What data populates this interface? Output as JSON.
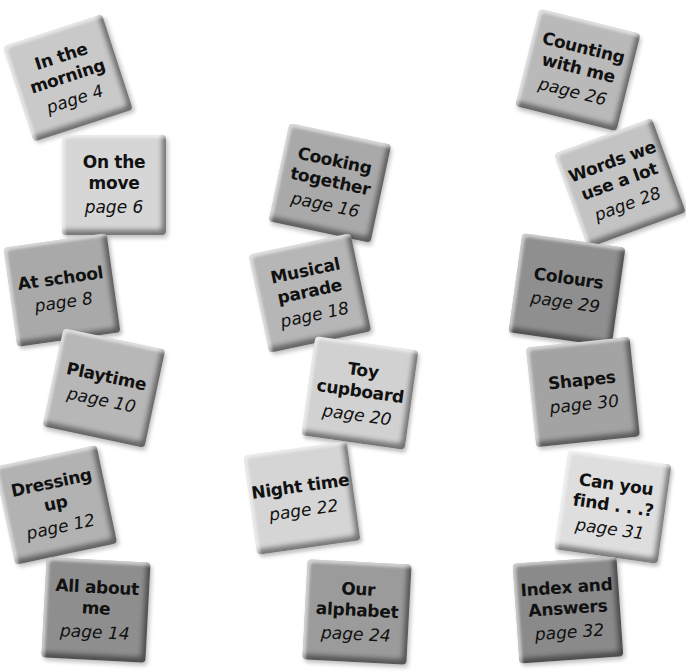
{
  "contents": {
    "tiles": [
      {
        "title": "In the morning",
        "page": "page 4",
        "x": 16,
        "y": 28,
        "rot": -18,
        "color": "#c9c9c9"
      },
      {
        "title": "On the move",
        "page": "page 6",
        "x": 62,
        "y": 135,
        "rot": 0,
        "color": "#d6d6d6"
      },
      {
        "title": "At school",
        "page": "page 8",
        "x": 10,
        "y": 240,
        "rot": -8,
        "color": "#a9a9a9"
      },
      {
        "title": "Playtime",
        "page": "page 10",
        "x": 52,
        "y": 338,
        "rot": 12,
        "color": "#b7b7b7"
      },
      {
        "title": "Dressing up",
        "page": "page 12",
        "x": 4,
        "y": 455,
        "rot": -12,
        "color": "#b2b2b2"
      },
      {
        "title": "All about me",
        "page": "page 14",
        "x": 44,
        "y": 560,
        "rot": 3,
        "color": "#8e8e8e"
      },
      {
        "title": "Cooking together",
        "page": "page 16",
        "x": 278,
        "y": 133,
        "rot": 12,
        "color": "#a9a9a9"
      },
      {
        "title": "Musical parade",
        "page": "page 18",
        "x": 258,
        "y": 243,
        "rot": -12,
        "color": "#b6b6b6"
      },
      {
        "title": "Toy cupboard",
        "page": "page 20",
        "x": 308,
        "y": 343,
        "rot": 8,
        "color": "#d1d1d1"
      },
      {
        "title": "Night time",
        "page": "page 22",
        "x": 250,
        "y": 448,
        "rot": -8,
        "color": "#d5d5d5"
      },
      {
        "title": "Our alphabet",
        "page": "page 24",
        "x": 305,
        "y": 562,
        "rot": 3,
        "color": "#9b9b9b"
      },
      {
        "title": "Counting with me",
        "page": "page 26",
        "x": 526,
        "y": 20,
        "rot": 14,
        "color": "#b9b9b9"
      },
      {
        "title": "Words we use a lot",
        "page": "page 28",
        "x": 568,
        "y": 133,
        "rot": -20,
        "color": "#c3c3c3"
      },
      {
        "title": "Colours",
        "page": "page 29",
        "x": 515,
        "y": 240,
        "rot": 8,
        "color": "#8f8f8f"
      },
      {
        "title": "Shapes",
        "page": "page 30",
        "x": 531,
        "y": 342,
        "rot": -6,
        "color": "#a3a3a3"
      },
      {
        "title": "Can you find . . .?",
        "page": "page 31",
        "x": 561,
        "y": 457,
        "rot": 8,
        "color": "#dedede"
      },
      {
        "title": "Index and Answers",
        "page": "page 32",
        "x": 516,
        "y": 560,
        "rot": -4,
        "color": "#8a8a8a"
      }
    ]
  }
}
